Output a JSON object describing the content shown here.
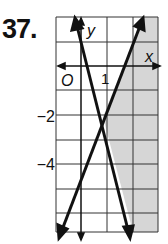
{
  "problem": {
    "number": "37."
  },
  "graph": {
    "x_axis_label": "x",
    "y_axis_label": "y",
    "origin_label": "O",
    "x_tick_label": "1",
    "y_tick_labels": [
      "-2",
      "-4"
    ],
    "shade_color": "#d6d6d6",
    "line_color": "#111111"
  }
}
